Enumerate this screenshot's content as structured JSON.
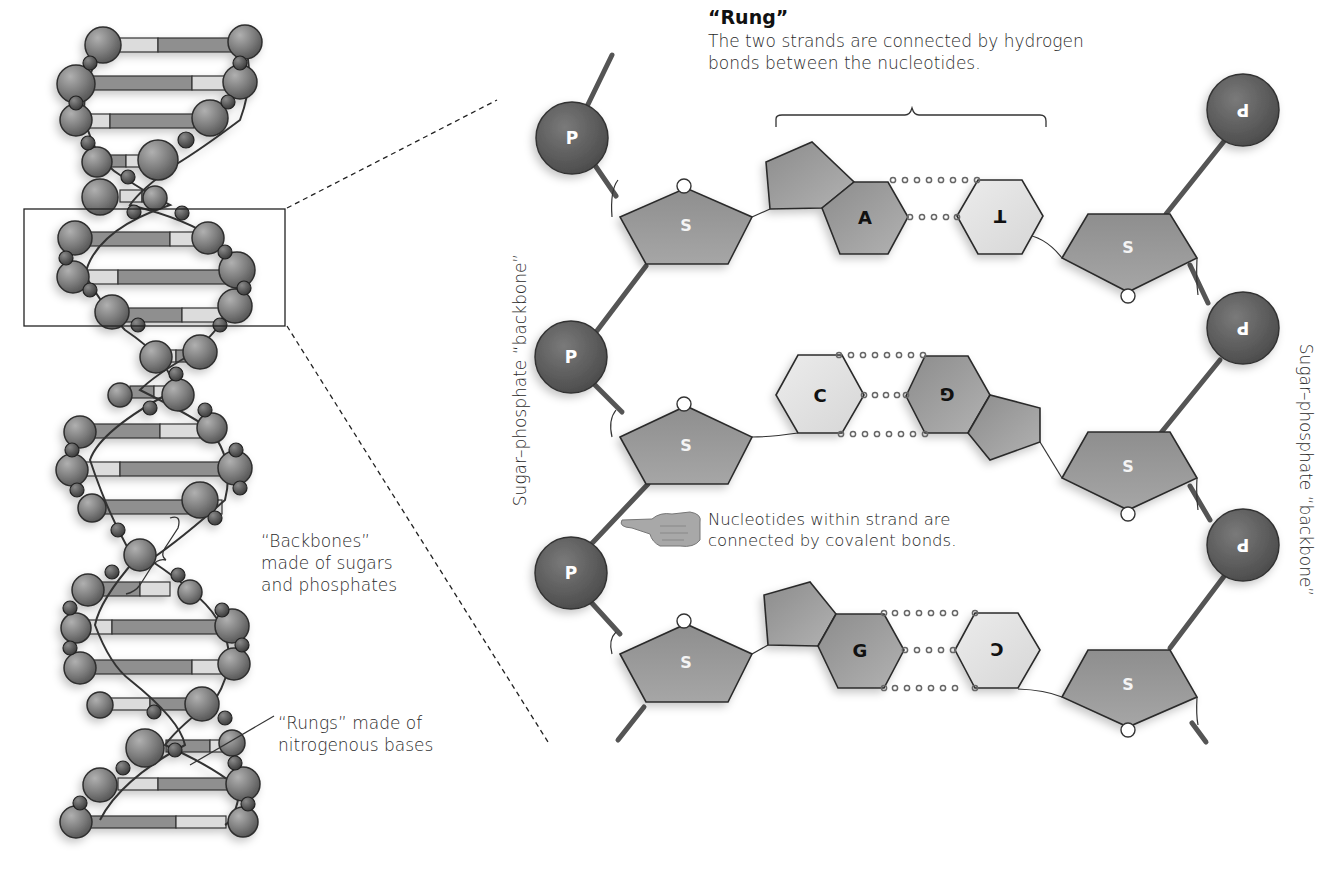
{
  "rung": {
    "title": "“Rung”",
    "description": "The two strands are connected by hydrogen bonds between the nucleotides."
  },
  "left_labels": {
    "backbones": "“Backbones” made of sugars and phosphates",
    "rungs": "“Rungs” made of nitrogenous bases"
  },
  "backbone_label_left": "Sugar–phosphate “backbone”",
  "backbone_label_right": "Sugar–phosphate “backbone”",
  "covalent_note": "Nucleotides within strand are connected by covalent bonds.",
  "symbols": {
    "phosphate": "P",
    "sugar": "S"
  },
  "base_pairs": [
    {
      "left": "A",
      "right": "T",
      "left_type": "purine",
      "right_type": "pyrimidine"
    },
    {
      "left": "C",
      "right": "G",
      "left_type": "pyrimidine",
      "right_type": "purine"
    },
    {
      "left": "G",
      "right": "C",
      "left_type": "purine",
      "right_type": "pyrimidine"
    }
  ],
  "colors": {
    "phosphate": "#5a5a5a",
    "sugar": "#8a8a8a",
    "purine": "#9a9a9a",
    "pyrimidine": "#e2e2e2",
    "outline": "#2b2b2b"
  }
}
